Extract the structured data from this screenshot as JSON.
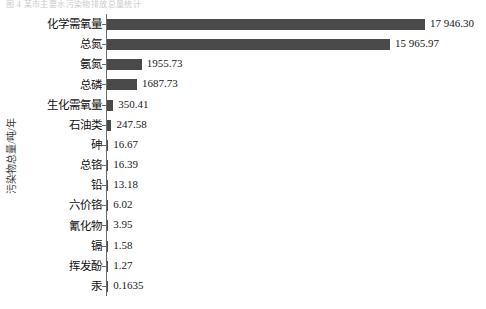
{
  "top_caption": "图 4  某市主要水污染物排放总量统计",
  "chart_data": {
    "type": "bar",
    "orientation": "horizontal",
    "title": "",
    "xlabel": "",
    "ylabel": "污染物总量/吨/年",
    "grid": false,
    "legend": null,
    "axis": {
      "value_axis_min": 0,
      "value_axis_max": 17946.3,
      "category_axis_line": true,
      "ticks": true
    },
    "bar_color": "#4a4a4a",
    "categories": [
      "化学需氧量",
      "总氮",
      "氨氮",
      "总磷",
      "生化需氧量",
      "石油类",
      "砷",
      "总铬",
      "铅",
      "六价铬",
      "氰化物",
      "镉",
      "挥发酚",
      "汞"
    ],
    "values": [
      17946.3,
      15965.97,
      1955.73,
      1687.73,
      350.41,
      247.58,
      16.67,
      16.39,
      13.18,
      6.02,
      3.95,
      1.58,
      1.27,
      0.1635
    ],
    "value_labels": [
      "17 946.30",
      "15 965.97",
      "1955.73",
      "1687.73",
      "350.41",
      "247.58",
      "16.67",
      "16.39",
      "13.18",
      "6.02",
      "3.95",
      "1.58",
      "1.27",
      "0.1635"
    ]
  }
}
